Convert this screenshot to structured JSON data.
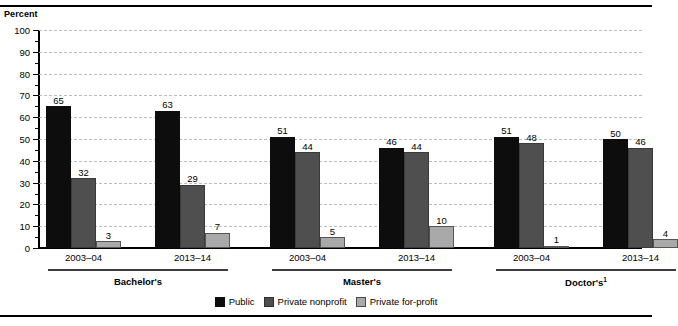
{
  "axis_title": "Percent",
  "top_clipped_text": "",
  "legend": {
    "items": [
      {
        "label": "Public",
        "key": "public",
        "color": "#0d0d0d"
      },
      {
        "label": "Private nonprofit",
        "key": "nonprofit",
        "color": "#4f4f4f"
      },
      {
        "label": "Private for-profit",
        "key": "forprofit",
        "color": "#a9a9a9"
      }
    ]
  },
  "groups": [
    {
      "label": "Bachelor's",
      "superscript": ""
    },
    {
      "label": "Master's",
      "superscript": ""
    },
    {
      "label": "Doctor's",
      "superscript": "1"
    }
  ],
  "years": [
    "2003–04",
    "2013–14"
  ],
  "chart_data": {
    "type": "bar",
    "title": "Percent",
    "xlabel": "",
    "ylabel": "Percent",
    "ylim": [
      0,
      100
    ],
    "ytick_labels": [
      "0",
      "10",
      "20",
      "30",
      "40",
      "50",
      "60",
      "70",
      "80",
      "90",
      "100"
    ],
    "yticks": [
      0,
      10,
      20,
      30,
      40,
      50,
      60,
      70,
      80,
      90,
      100
    ],
    "grid": true,
    "legend_position": "bottom",
    "group_labels": [
      "Bachelor's",
      "Master's",
      "Doctor's"
    ],
    "categories": [
      "Bachelor's 2003–04",
      "Bachelor's 2013–14",
      "Master's 2003–04",
      "Master's 2013–14",
      "Doctor's 2003–04",
      "Doctor's 2013–14"
    ],
    "series": [
      {
        "name": "Public",
        "values": [
          65,
          63,
          51,
          46,
          51,
          50
        ]
      },
      {
        "name": "Private nonprofit",
        "values": [
          32,
          29,
          44,
          44,
          48,
          46
        ]
      },
      {
        "name": "Private for-profit",
        "values": [
          3,
          7,
          5,
          10,
          1,
          4
        ]
      }
    ]
  }
}
